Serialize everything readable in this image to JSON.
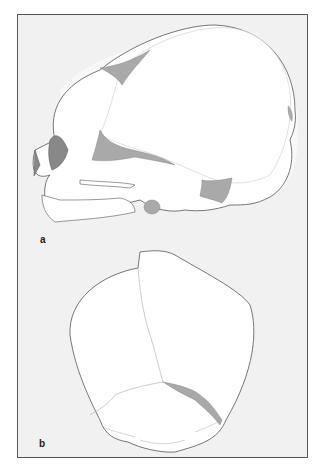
{
  "figure": {
    "panels": [
      {
        "label": "a",
        "view": "lateral view of infant skull"
      },
      {
        "label": "b",
        "view": "superior view of infant skull"
      }
    ],
    "colors": {
      "background": "#f1f1f1",
      "bone": "#ffffff",
      "fontanelle": "#a9a9a9",
      "outline": "#555555",
      "frame": "#555555"
    }
  }
}
